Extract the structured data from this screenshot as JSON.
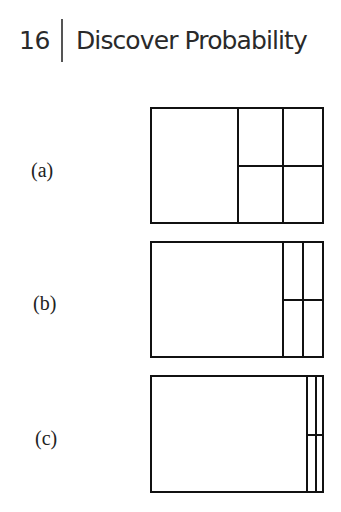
{
  "header": {
    "page_number": "16",
    "chapter_title": "Discover Probability"
  },
  "figures": [
    {
      "label": "(a)",
      "box": {
        "left": 150,
        "top": 107,
        "width": 174,
        "height": 117
      },
      "dividers_x": [
        236,
        281
      ],
      "divider_y": 164,
      "divided_region_start_x": 236
    },
    {
      "label": "(b)",
      "box": {
        "left": 150,
        "top": 241,
        "width": 174,
        "height": 117
      },
      "dividers_x": [
        281,
        301
      ],
      "divider_y": 298,
      "divided_region_start_x": 281
    },
    {
      "label": "(c)",
      "box": {
        "left": 150,
        "top": 375,
        "width": 174,
        "height": 118
      },
      "dividers_x": [
        304,
        313
      ],
      "divider_y": 433,
      "divided_region_start_x": 304
    }
  ]
}
